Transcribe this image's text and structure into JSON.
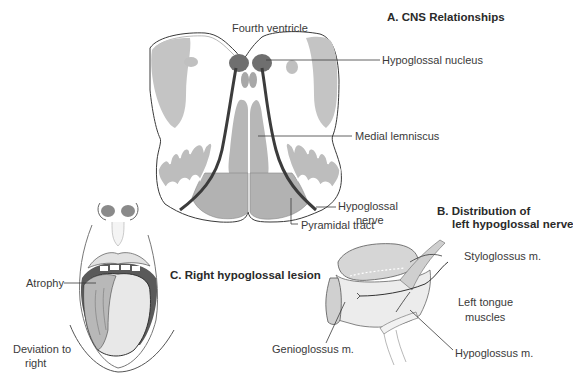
{
  "panels": {
    "a": {
      "title": "A. CNS Relationships",
      "labels": {
        "fourth_ventricle": "Fourth ventricle",
        "hypoglossal_nucleus": "Hypoglossal nucleus",
        "medial_lemniscus": "Medial lemniscus",
        "hypoglossal_nerve_line1": "Hypoglossal",
        "hypoglossal_nerve_line2": "nerve",
        "pyramidal_tract": "Pyramidal tract"
      }
    },
    "b": {
      "title_line1": "B. Distribution of",
      "title_line2": "left hypoglossal nerve",
      "labels": {
        "styloglossus": "Styloglossus m.",
        "left_tongue_muscles_line1": "Left tongue",
        "left_tongue_muscles_line2": "muscles",
        "genioglossus": "Genioglossus m.",
        "hypoglossus": "Hypoglossus m."
      }
    },
    "c": {
      "title": "C. Right hypoglossal lesion",
      "labels": {
        "atrophy": "Atrophy",
        "deviation_line1": "Deviation to",
        "deviation_line2": "right"
      }
    }
  },
  "colors": {
    "outline": "#3a3a3a",
    "gray_fill": "#bdbdbd",
    "dark_fill": "#6e6e6e",
    "nerve": "#3c3c3c",
    "pyramid": "#b0b0b0"
  }
}
